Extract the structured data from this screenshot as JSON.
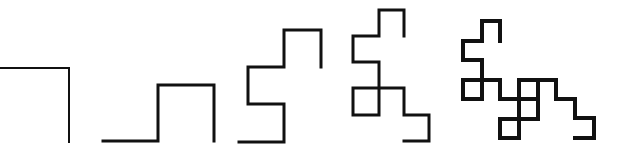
{
  "figure": {
    "background": "#ffffff",
    "stroke_color": "#111111",
    "iterations": [
      {
        "id": 1,
        "stroke_width": 2,
        "points": "0,68 69,68 69,142"
      },
      {
        "id": 2,
        "stroke_width": 3,
        "points": "103,141 158,141 158,85 214,85 214,141"
      },
      {
        "id": 3,
        "stroke_width": 3,
        "points": "239,142 284,142 284,104 248,104 248,67 284,67 284,30 321,30 321,67"
      },
      {
        "id": 4,
        "stroke_width": 3,
        "points": "404,141 429,141 429,115 404,115 404,88 353,88 353,115 379,115 379,62 353,62 353,36 379,36 379,10 404,10 404,36"
      },
      {
        "id": 5,
        "stroke_width": 4,
        "points": "575,138 594,138 594,118 575,118 575,99 556,99 556,80 538,80 538,119 500,119 500,138 519,138 519,80 538,80 538,99 500,99 500,80 463,80 463,99 482,99 482,60 463,60 463,41 482,41 482,21 500,21 500,41"
      }
    ]
  }
}
